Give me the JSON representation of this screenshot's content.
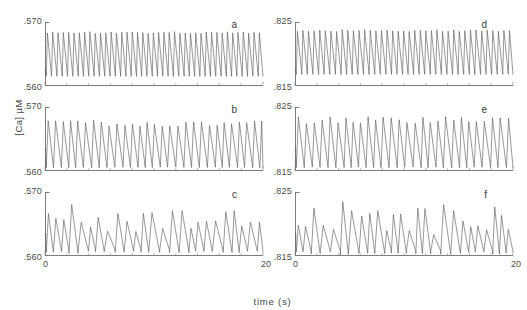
{
  "figure": {
    "ylabel": "[Ca] µM",
    "xlabel": "time (s)"
  },
  "chart_data": {
    "type": "line",
    "title": "",
    "xlabel": "time (s)",
    "ylabel": "[Ca] µM",
    "xlim": [
      0,
      20
    ],
    "grid": false,
    "legend": "none",
    "layout": "2 columns x 3 rows",
    "panels": [
      {
        "letter": "a",
        "column": "left",
        "row": 1,
        "ylim": [
          0.56,
          0.57
        ],
        "ytick_labels": [
          ".560",
          ".570"
        ],
        "xtick_labels": [
          "0",
          "20"
        ],
        "xlim": [
          0,
          20
        ],
        "description": "regular high-frequency spike train, constant amplitude",
        "frequency_hz": 2.05,
        "baseline": 0.5625,
        "peak": 0.5685,
        "trough": 0.5615,
        "n_spikes": 41,
        "waveform": "sawtooth-spike",
        "regularity": "regular"
      },
      {
        "letter": "b",
        "column": "left",
        "row": 2,
        "ylim": [
          0.56,
          0.57
        ],
        "ytick_labels": [
          ".560",
          ".570"
        ],
        "xtick_labels": [
          "0",
          "20"
        ],
        "xlim": [
          0,
          20
        ],
        "description": "large amplitude oscillations, mildly irregular period",
        "frequency_hz": 1.45,
        "baseline": 0.5635,
        "peak": 0.568,
        "trough": 0.5605,
        "n_spikes": 29,
        "waveform": "sawtooth-spike",
        "regularity": "quasi-periodic"
      },
      {
        "letter": "c",
        "column": "left",
        "row": 3,
        "ylim": [
          0.56,
          0.57
        ],
        "ytick_labels": [
          ".560",
          ".570"
        ],
        "xtick_labels": [
          "0",
          "20"
        ],
        "xlim": [
          0,
          20
        ],
        "description": "irregular bursting, alternating tall and short spikes",
        "frequency_hz": 1.25,
        "baseline": 0.5635,
        "peak": 0.5682,
        "trough": 0.5604,
        "n_spikes": 25,
        "waveform": "sawtooth-spike",
        "regularity": "irregular"
      },
      {
        "letter": "d",
        "column": "right",
        "row": 1,
        "ylim": [
          0.815,
          0.825
        ],
        "ytick_labels": [
          ".815",
          ".825"
        ],
        "xtick_labels": [
          "0",
          "20"
        ],
        "xlim": [
          0,
          20
        ],
        "description": "regular high-frequency spike train, constant amplitude",
        "frequency_hz": 1.95,
        "baseline": 0.8175,
        "peak": 0.8238,
        "trough": 0.8168,
        "n_spikes": 39,
        "waveform": "sawtooth-spike",
        "regularity": "regular"
      },
      {
        "letter": "e",
        "column": "right",
        "row": 2,
        "ylim": [
          0.815,
          0.825
        ],
        "ytick_labels": [
          ".815",
          ".825"
        ],
        "xtick_labels": [
          "0",
          "20"
        ],
        "xlim": [
          0,
          20
        ],
        "description": "large amplitude oscillations, mildly irregular period",
        "frequency_hz": 1.4,
        "baseline": 0.8185,
        "peak": 0.8235,
        "trough": 0.8155,
        "n_spikes": 28,
        "waveform": "sawtooth-spike",
        "regularity": "quasi-periodic"
      },
      {
        "letter": "f",
        "column": "right",
        "row": 3,
        "ylim": [
          0.815,
          0.825
        ],
        "ytick_labels": [
          ".815",
          ".825"
        ],
        "xtick_labels": [
          "0",
          "20"
        ],
        "xlim": [
          0,
          20
        ],
        "description": "complex irregular oscillations with varying amplitude",
        "frequency_hz": 1.3,
        "baseline": 0.8185,
        "peak": 0.8236,
        "trough": 0.8152,
        "n_spikes": 26,
        "waveform": "sawtooth-spike",
        "regularity": "irregular"
      }
    ]
  }
}
